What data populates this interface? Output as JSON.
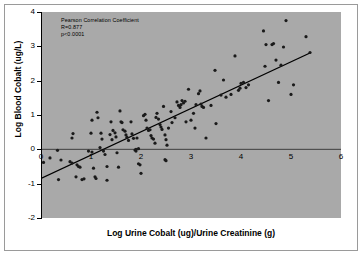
{
  "chart_data": {
    "type": "scatter",
    "title": "",
    "xlabel": "Log Urine Cobalt (ug)/Urine Creatinine (g)",
    "ylabel": "Log Blood Cobalt (ug/L)",
    "xlim": [
      0,
      6
    ],
    "ylim": [
      -2,
      4
    ],
    "xticks": [
      0,
      1,
      2,
      3,
      4,
      5,
      6
    ],
    "yticks": [
      -2,
      -1,
      0,
      1,
      2,
      3,
      4
    ],
    "xtick_labels": [
      "0",
      "1",
      "2",
      "3",
      "4",
      "5",
      "6"
    ],
    "ytick_labels": [
      "-2",
      "-1",
      "0",
      "1",
      "2",
      "3",
      "4"
    ],
    "grid": false,
    "legend": "none",
    "plot_background": "#a9a9a9",
    "marker_color": "#1a1a1a",
    "line_color": "#000000",
    "annotations": [
      "Pearson Correlation Coefficient",
      "R=0.877",
      "p<0.0001"
    ],
    "trendline": {
      "x_start": 0.0,
      "y_start": -0.85,
      "x_end": 5.4,
      "y_end": 2.82
    },
    "points": [
      [
        0.05,
        -0.38
      ],
      [
        0.18,
        -0.25
      ],
      [
        0.33,
        -0.03
      ],
      [
        0.4,
        -0.31
      ],
      [
        0.62,
        0.33
      ],
      [
        0.64,
        0.46
      ],
      [
        0.58,
        -0.36
      ],
      [
        0.62,
        -0.4
      ],
      [
        0.72,
        -0.45
      ],
      [
        0.75,
        -0.5
      ],
      [
        0.78,
        -0.52
      ],
      [
        0.7,
        -0.8
      ],
      [
        0.82,
        -0.88
      ],
      [
        0.86,
        -0.86
      ],
      [
        0.35,
        -0.88
      ],
      [
        1.0,
        0.47
      ],
      [
        1.02,
        0.85
      ],
      [
        1.12,
        1.08
      ],
      [
        1.14,
        0.92
      ],
      [
        1.2,
        0.47
      ],
      [
        1.22,
        0.3
      ],
      [
        1.18,
        0.05
      ],
      [
        1.25,
        -0.05
      ],
      [
        1.28,
        -0.15
      ],
      [
        1.05,
        -0.55
      ],
      [
        1.1,
        -0.85
      ],
      [
        1.08,
        -0.8
      ],
      [
        1.32,
        -0.9
      ],
      [
        1.38,
        0.43
      ],
      [
        1.42,
        0.28
      ],
      [
        1.4,
        0.8
      ],
      [
        1.44,
        0.55
      ],
      [
        1.48,
        0.48
      ],
      [
        1.5,
        0.36
      ],
      [
        1.52,
        -0.1
      ],
      [
        1.55,
        -0.52
      ],
      [
        1.58,
        1.12
      ],
      [
        1.6,
        0.8
      ],
      [
        1.62,
        0.78
      ],
      [
        1.64,
        0.57
      ],
      [
        1.68,
        0.53
      ],
      [
        1.7,
        0.42
      ],
      [
        1.72,
        0.35
      ],
      [
        1.75,
        0.26
      ],
      [
        1.8,
        0.8
      ],
      [
        1.82,
        0.45
      ],
      [
        1.85,
        0.32
      ],
      [
        1.88,
        -0.02
      ],
      [
        1.9,
        -0.05
      ],
      [
        1.92,
        0.33
      ],
      [
        1.95,
        -0.42
      ],
      [
        1.98,
        -0.45
      ],
      [
        2.0,
        -0.7
      ],
      [
        2.05,
        0.98
      ],
      [
        2.08,
        1.02
      ],
      [
        2.1,
        0.85
      ],
      [
        2.12,
        0.62
      ],
      [
        2.15,
        0.55
      ],
      [
        2.18,
        0.57
      ],
      [
        2.2,
        0.4
      ],
      [
        2.22,
        0.33
      ],
      [
        2.25,
        0.3
      ],
      [
        2.28,
        0.18
      ],
      [
        2.3,
        0.93
      ],
      [
        2.32,
        1.05
      ],
      [
        2.35,
        0.88
      ],
      [
        2.38,
        0.72
      ],
      [
        2.4,
        0.65
      ],
      [
        2.42,
        0.58
      ],
      [
        2.45,
        1.25
      ],
      [
        2.48,
        0.42
      ],
      [
        2.5,
        0.28
      ],
      [
        2.52,
        0.12
      ],
      [
        2.55,
        0.62
      ],
      [
        2.6,
        1.1
      ],
      [
        2.62,
        0.78
      ],
      [
        2.68,
        0.92
      ],
      [
        2.72,
        1.38
      ],
      [
        2.75,
        1.28
      ],
      [
        2.78,
        1.22
      ],
      [
        2.8,
        1.3
      ],
      [
        2.82,
        1.42
      ],
      [
        2.85,
        1.35
      ],
      [
        2.88,
        1.4
      ],
      [
        2.9,
        0.8
      ],
      [
        2.95,
        1.75
      ],
      [
        3.0,
        0.85
      ],
      [
        3.05,
        1.05
      ],
      [
        3.08,
        0.62
      ],
      [
        3.1,
        1.3
      ],
      [
        3.15,
        1.62
      ],
      [
        3.18,
        1.7
      ],
      [
        3.2,
        1.32
      ],
      [
        3.22,
        1.25
      ],
      [
        3.25,
        1.22
      ],
      [
        3.3,
        0.33
      ],
      [
        3.4,
        1.28
      ],
      [
        3.48,
        2.3
      ],
      [
        3.5,
        0.75
      ],
      [
        3.6,
        1.58
      ],
      [
        3.65,
        2.02
      ],
      [
        3.7,
        1.52
      ],
      [
        3.8,
        1.6
      ],
      [
        3.88,
        2.72
      ],
      [
        3.95,
        1.72
      ],
      [
        3.98,
        1.78
      ],
      [
        4.0,
        1.92
      ],
      [
        4.05,
        1.95
      ],
      [
        4.1,
        1.8
      ],
      [
        4.15,
        1.88
      ],
      [
        4.45,
        3.45
      ],
      [
        4.48,
        2.42
      ],
      [
        4.5,
        3.05
      ],
      [
        4.55,
        1.42
      ],
      [
        4.62,
        3.05
      ],
      [
        4.65,
        3.08
      ],
      [
        4.7,
        2.6
      ],
      [
        4.75,
        1.95
      ],
      [
        4.8,
        2.45
      ],
      [
        4.85,
        2.98
      ],
      [
        4.9,
        3.75
      ],
      [
        5.0,
        1.6
      ],
      [
        5.05,
        1.88
      ],
      [
        5.3,
        3.28
      ],
      [
        5.38,
        2.82
      ],
      [
        2.48,
        -0.3
      ],
      [
        2.5,
        -0.33
      ],
      [
        1.32,
        -0.5
      ],
      [
        1.9,
        0.0
      ],
      [
        1.95,
        0.02
      ],
      [
        0.95,
        -0.05
      ],
      [
        1.02,
        -0.08
      ]
    ]
  }
}
